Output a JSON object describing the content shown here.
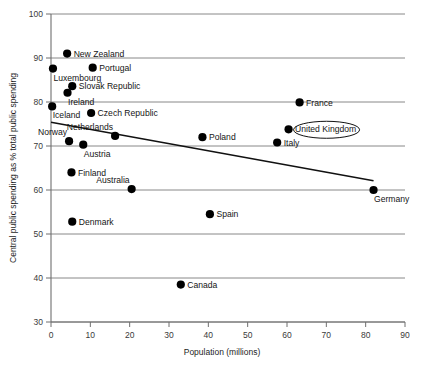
{
  "chart_data": {
    "type": "scatter",
    "title": "",
    "xlabel": "Population (millions)",
    "ylabel": "Central public spending as % total public spending",
    "xlim": [
      0,
      90
    ],
    "ylim": [
      30,
      100
    ],
    "xticks": [
      0,
      10,
      20,
      30,
      40,
      50,
      60,
      70,
      80,
      90
    ],
    "yticks": [
      30,
      40,
      50,
      60,
      70,
      80,
      90,
      100
    ],
    "grid": "horizontal",
    "legend": "none",
    "highlighted_point": "United Kingdom",
    "points": [
      {
        "label": "Iceland",
        "x": 0.3,
        "y": 79.0,
        "label_pos": "below-right"
      },
      {
        "label": "Luxembourg",
        "x": 0.5,
        "y": 87.6,
        "label_pos": "below-right"
      },
      {
        "label": "New Zealand",
        "x": 4.1,
        "y": 91.0,
        "label_pos": "right"
      },
      {
        "label": "Ireland",
        "x": 4.2,
        "y": 82.1,
        "label_pos": "below-right"
      },
      {
        "label": "Norway",
        "x": 4.6,
        "y": 71.1,
        "label_pos": "above-right"
      },
      {
        "label": "Denmark",
        "x": 5.4,
        "y": 52.8,
        "label_pos": "right"
      },
      {
        "label": "Finland",
        "x": 5.2,
        "y": 64.0,
        "label_pos": "right"
      },
      {
        "label": "Slovak Republic",
        "x": 5.4,
        "y": 83.6,
        "label_pos": "right"
      },
      {
        "label": "Austria",
        "x": 8.2,
        "y": 70.3,
        "label_pos": "below-right"
      },
      {
        "label": "Portugal",
        "x": 10.6,
        "y": 87.8,
        "label_pos": "right"
      },
      {
        "label": "Czech Republic",
        "x": 10.2,
        "y": 77.5,
        "label_pos": "right"
      },
      {
        "label": "Netherlands",
        "x": 16.3,
        "y": 72.3,
        "label_pos": "above-right"
      },
      {
        "label": "Australia",
        "x": 20.5,
        "y": 60.2,
        "label_pos": "above-right"
      },
      {
        "label": "Canada",
        "x": 33.0,
        "y": 38.5,
        "label_pos": "right"
      },
      {
        "label": "Poland",
        "x": 38.5,
        "y": 72.0,
        "label_pos": "right"
      },
      {
        "label": "Spain",
        "x": 40.4,
        "y": 54.5,
        "label_pos": "right"
      },
      {
        "label": "Italy",
        "x": 57.5,
        "y": 70.8,
        "label_pos": "right"
      },
      {
        "label": "United Kingdom",
        "x": 60.4,
        "y": 73.8,
        "label_pos": "right"
      },
      {
        "label": "France",
        "x": 63.2,
        "y": 79.9,
        "label_pos": "right"
      },
      {
        "label": "Germany",
        "x": 82.0,
        "y": 60.0,
        "label_pos": "below-right"
      }
    ],
    "trendline": {
      "x_start": 0,
      "y_start": 75.4,
      "x_end": 82.0,
      "y_end": 62.1
    }
  },
  "colors": {
    "marker": "#000000",
    "trendline": "#111111",
    "gridline": "#7b7b7b",
    "axis": "#6f6f6f",
    "text": "#151515",
    "background": "#ffffff"
  }
}
